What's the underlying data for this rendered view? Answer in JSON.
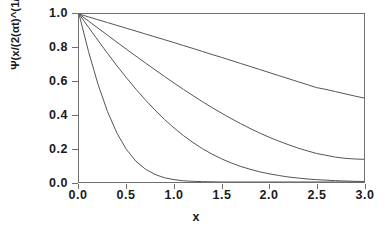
{
  "chart_data": {
    "type": "line",
    "title": "",
    "xlabel": "x",
    "ylabel": "Ψ(x/(2(αt)^(1/2))",
    "xlim": [
      0.0,
      3.0
    ],
    "ylim": [
      0.0,
      1.0
    ],
    "grid": false,
    "legend": "none",
    "xticks": [
      "0.0",
      "0.5",
      "1.0",
      "1.5",
      "2.0",
      "2.5",
      "3.0"
    ],
    "xtick_values": [
      0.0,
      0.5,
      1.0,
      1.5,
      2.0,
      2.5,
      3.0
    ],
    "yticks": [
      "0.0",
      "0.2",
      "0.4",
      "0.6",
      "0.8",
      "1.0"
    ],
    "ytick_values": [
      0.0,
      0.2,
      0.4,
      0.6,
      0.8,
      1.0
    ],
    "line_color": "#555555",
    "axis_color": "#6f6f6f",
    "background": "#ffffff",
    "x": [
      0.0,
      0.1,
      0.2,
      0.3,
      0.4,
      0.5,
      0.6,
      0.7,
      0.8,
      0.9,
      1.0,
      1.1,
      1.2,
      1.3,
      1.4,
      1.5,
      1.6,
      1.7,
      1.8,
      1.9,
      2.0,
      2.1,
      2.2,
      2.3,
      2.4,
      2.5,
      2.6,
      2.7,
      2.8,
      2.9,
      3.0
    ],
    "series": [
      {
        "name": "curve-1-slowest-decay",
        "values": [
          1.0,
          0.983,
          0.966,
          0.949,
          0.932,
          0.915,
          0.898,
          0.881,
          0.864,
          0.847,
          0.83,
          0.812,
          0.795,
          0.777,
          0.759,
          0.742,
          0.724,
          0.706,
          0.688,
          0.67,
          0.652,
          0.634,
          0.616,
          0.598,
          0.58,
          0.562,
          0.551,
          0.538,
          0.525,
          0.512,
          0.5
        ]
      },
      {
        "name": "curve-2",
        "values": [
          1.0,
          0.958,
          0.916,
          0.874,
          0.832,
          0.79,
          0.749,
          0.708,
          0.668,
          0.628,
          0.589,
          0.551,
          0.514,
          0.478,
          0.443,
          0.41,
          0.378,
          0.348,
          0.319,
          0.292,
          0.267,
          0.244,
          0.223,
          0.203,
          0.186,
          0.17,
          0.159,
          0.148,
          0.141,
          0.137,
          0.135
        ]
      },
      {
        "name": "curve-3",
        "values": [
          1.0,
          0.921,
          0.843,
          0.766,
          0.691,
          0.62,
          0.552,
          0.488,
          0.428,
          0.372,
          0.322,
          0.276,
          0.235,
          0.198,
          0.166,
          0.138,
          0.114,
          0.093,
          0.076,
          0.061,
          0.049,
          0.039,
          0.03,
          0.024,
          0.018,
          0.014,
          0.011,
          0.008,
          0.006,
          0.004,
          0.003
        ]
      },
      {
        "name": "curve-4-fastest-decay",
        "values": [
          1.0,
          0.777,
          0.582,
          0.419,
          0.29,
          0.193,
          0.123,
          0.076,
          0.045,
          0.025,
          0.014,
          0.007,
          0.004,
          0.002,
          0.001,
          0.0,
          0.0,
          0.0,
          0.0,
          0.0,
          0.0,
          0.0,
          0.0,
          0.0,
          0.0,
          0.0,
          0.0,
          0.0,
          0.0,
          0.0,
          0.0
        ]
      }
    ]
  }
}
